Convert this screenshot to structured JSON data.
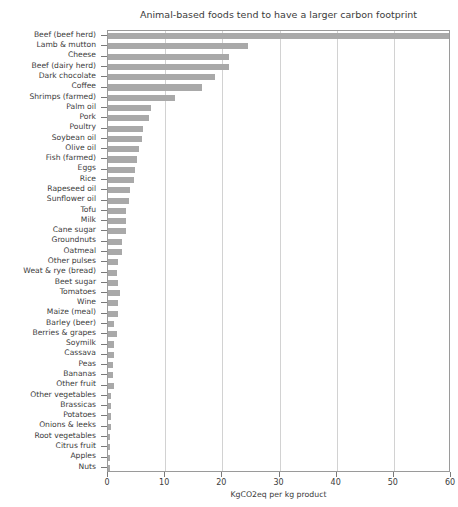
{
  "chart_data": {
    "type": "bar",
    "orientation": "horizontal",
    "title": "Animal-based foods tend to have a larger carbon footprint",
    "xlabel": "KgCO2eq per kg product",
    "ylabel": "",
    "xlim": [
      0,
      60
    ],
    "ylim": null,
    "xticks": [
      0,
      10,
      20,
      30,
      40,
      50,
      60
    ],
    "xticklabels": [
      "0",
      "10",
      "20",
      "30",
      "40",
      "50",
      "60"
    ],
    "grid": "vertical-only",
    "legend": null,
    "bar_color": "#a9a9a9",
    "categories": [
      "Beef (beef herd)",
      "Lamb & mutton",
      "Cheese",
      "Beef (dairy herd)",
      "Dark chocolate",
      "Coffee",
      "Shrimps (farmed)",
      "Palm oil",
      "Pork",
      "Poultry",
      "Soybean oil",
      "Olive oil",
      "Fish (farmed)",
      "Eggs",
      "Rice",
      "Rapeseed oil",
      "Sunflower oil",
      "Tofu",
      "Milk",
      "Cane sugar",
      "Groundnuts",
      "Oatmeal",
      "Other pulses",
      "Weat & rye (bread)",
      "Beet sugar",
      "Tomatoes",
      "Wine",
      "Maize (meal)",
      "Barley (beer)",
      "Berries & grapes",
      "Soymilk",
      "Cassava",
      "Peas",
      "Bananas",
      "Other fruit",
      "Other vegetables",
      "Brassicas",
      "Potatoes",
      "Onions & leeks",
      "Root vegetables",
      "Citrus fruit",
      "Apples",
      "Nuts"
    ],
    "values": [
      59.6,
      24.5,
      21.2,
      21.1,
      18.7,
      16.5,
      11.8,
      7.6,
      7.2,
      6.1,
      6.0,
      5.4,
      5.1,
      4.7,
      4.5,
      3.8,
      3.6,
      3.2,
      3.2,
      3.2,
      2.5,
      2.5,
      1.8,
      1.6,
      1.8,
      2.1,
      1.8,
      1.7,
      1.1,
      1.5,
      1.0,
      1.0,
      0.9,
      0.9,
      1.1,
      0.5,
      0.5,
      0.5,
      0.5,
      0.4,
      0.3,
      0.4,
      0.3
    ]
  }
}
